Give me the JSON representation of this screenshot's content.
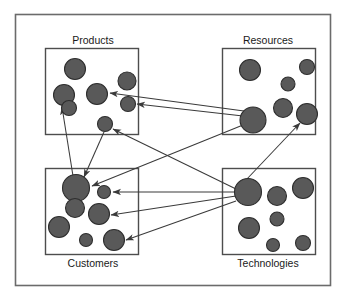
{
  "diagram": {
    "type": "network-cluster-diagram",
    "title": "",
    "canvas": {
      "width": 353,
      "height": 299
    },
    "style": {
      "background_color": "#ffffff",
      "frame_color": "#6b6b6b",
      "box_border_color": "#4d4d4d",
      "node_fill_color": "#595959",
      "node_stroke_color": "#2e2e2e",
      "arrow_color": "#3a3a3a",
      "label_color": "#1a1a1a"
    },
    "frame": {
      "x": 15,
      "y": 14,
      "width": 315,
      "height": 271
    },
    "clusters": [
      {
        "id": "products",
        "label": "Products",
        "label_position": "top",
        "label_x": 93,
        "label_y": 41,
        "box": {
          "x": 45,
          "y": 48,
          "width": 93,
          "height": 86
        },
        "nodes": [
          {
            "id": "p1",
            "cx": 75,
            "cy": 69,
            "r": 10.5
          },
          {
            "id": "p2",
            "cx": 127,
            "cy": 81,
            "r": 9.0
          },
          {
            "id": "p3",
            "cx": 64,
            "cy": 95,
            "r": 10.5
          },
          {
            "id": "p4",
            "cx": 97,
            "cy": 94,
            "r": 10.5
          },
          {
            "id": "p5",
            "cx": 69,
            "cy": 108,
            "r": 7.5
          },
          {
            "id": "p6",
            "cx": 128,
            "cy": 104,
            "r": 7.5
          },
          {
            "id": "p7",
            "cx": 105,
            "cy": 124,
            "r": 7.5
          }
        ]
      },
      {
        "id": "resources",
        "label": "Resources",
        "label_position": "top",
        "label_x": 268,
        "label_y": 41,
        "box": {
          "x": 222,
          "y": 48,
          "width": 93,
          "height": 86
        },
        "nodes": [
          {
            "id": "r1",
            "cx": 250,
            "cy": 70,
            "r": 10.5
          },
          {
            "id": "r2",
            "cx": 307,
            "cy": 67,
            "r": 7.5
          },
          {
            "id": "r3",
            "cx": 288,
            "cy": 84,
            "r": 7.0
          },
          {
            "id": "r4",
            "cx": 283,
            "cy": 108,
            "r": 9.5
          },
          {
            "id": "r5",
            "cx": 253,
            "cy": 120,
            "r": 13.0
          },
          {
            "id": "r6",
            "cx": 307,
            "cy": 114,
            "r": 10.5
          }
        ]
      },
      {
        "id": "customers",
        "label": "Customers",
        "label_position": "bottom",
        "label_x": 93,
        "label_y": 264,
        "box": {
          "x": 45,
          "y": 168,
          "width": 93,
          "height": 86
        },
        "nodes": [
          {
            "id": "c1",
            "cx": 76,
            "cy": 188,
            "r": 13.5
          },
          {
            "id": "c2",
            "cx": 104,
            "cy": 192,
            "r": 6.5
          },
          {
            "id": "c3",
            "cx": 75,
            "cy": 208,
            "r": 9.5
          },
          {
            "id": "c4",
            "cx": 99,
            "cy": 214,
            "r": 10.5
          },
          {
            "id": "c5",
            "cx": 59,
            "cy": 227,
            "r": 10.5
          },
          {
            "id": "c6",
            "cx": 86,
            "cy": 240,
            "r": 6.5
          },
          {
            "id": "c7",
            "cx": 114,
            "cy": 240,
            "r": 10.5
          }
        ]
      },
      {
        "id": "technologies",
        "label": "Technologies",
        "label_position": "bottom",
        "label_x": 268,
        "label_y": 264,
        "box": {
          "x": 222,
          "y": 168,
          "width": 93,
          "height": 86
        },
        "nodes": [
          {
            "id": "t1",
            "cx": 248,
            "cy": 192,
            "r": 13.5
          },
          {
            "id": "t2",
            "cx": 277,
            "cy": 196,
            "r": 9.5
          },
          {
            "id": "t3",
            "cx": 303,
            "cy": 188,
            "r": 10.5
          },
          {
            "id": "t4",
            "cx": 277,
            "cy": 219,
            "r": 7.0
          },
          {
            "id": "t5",
            "cx": 249,
            "cy": 228,
            "r": 10.5
          },
          {
            "id": "t6",
            "cx": 273,
            "cy": 245,
            "r": 6.5
          },
          {
            "id": "t7",
            "cx": 303,
            "cy": 243,
            "r": 7.5
          }
        ]
      }
    ],
    "arrows": [
      {
        "id": "a1",
        "from": "resources.r5",
        "to": "products.p4",
        "x1": 244,
        "y1": 111,
        "x2": 110,
        "y2": 93
      },
      {
        "id": "a2",
        "from": "resources.r5",
        "to": "products.p6",
        "x1": 243,
        "y1": 116,
        "x2": 137,
        "y2": 104
      },
      {
        "id": "a3",
        "from": "customers.c1",
        "to": "products.p3",
        "x1": 73,
        "y1": 176,
        "x2": 62,
        "y2": 107
      },
      {
        "id": "a4",
        "from": "products.p7",
        "to": "customers.c1",
        "x1": 104,
        "y1": 132,
        "x2": 84,
        "y2": 177
      },
      {
        "id": "a5",
        "from": "technologies.t1",
        "to": "products.p7",
        "x1": 236,
        "y1": 189,
        "x2": 113,
        "y2": 129
      },
      {
        "id": "a6",
        "from": "resources.r5",
        "to": "customers.c1",
        "x1": 243,
        "y1": 125,
        "x2": 92,
        "y2": 186
      },
      {
        "id": "a7",
        "from": "technologies.t1",
        "to": "customers.c2",
        "x1": 235,
        "y1": 192,
        "x2": 113,
        "y2": 192
      },
      {
        "id": "a8",
        "from": "technologies.t1",
        "to": "customers.c4",
        "x1": 236,
        "y1": 196,
        "x2": 111,
        "y2": 215
      },
      {
        "id": "a9",
        "from": "technologies.t1",
        "to": "customers.c7",
        "x1": 236,
        "y1": 201,
        "x2": 126,
        "y2": 240
      },
      {
        "id": "a10",
        "from": "technologies.t1",
        "to": "resources.r6",
        "x1": 246,
        "y1": 180,
        "x2": 300,
        "y2": 123
      }
    ]
  }
}
